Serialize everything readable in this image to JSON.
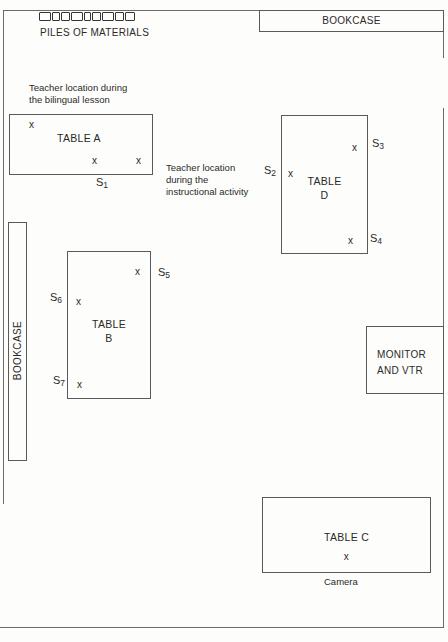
{
  "diagram": {
    "type": "classroom floor plan",
    "labels": {
      "piles_of_materials": "PILES OF MATERIALS",
      "bookcase_top": "BOOKCASE",
      "bookcase_left": "BOOKCASE",
      "teacher_bilingual": "Teacher location during\nthe bilingual lesson",
      "teacher_instructional": "Teacher location\nduring the\ninstructional activity",
      "monitor": "MONITOR\nAND VTR",
      "camera": "Camera"
    },
    "tables": {
      "a": {
        "line1": "TABLE A"
      },
      "b": {
        "line1": "TABLE",
        "line2": "B"
      },
      "c": {
        "line1": "TABLE C"
      },
      "d": {
        "line1": "TABLE",
        "line2": "D"
      }
    },
    "marker": "x",
    "students": {
      "s1": {
        "letter": "S",
        "num": "1"
      },
      "s2": {
        "letter": "S",
        "num": "2"
      },
      "s3": {
        "letter": "S",
        "num": "3"
      },
      "s4": {
        "letter": "S",
        "num": "4"
      },
      "s5": {
        "letter": "S",
        "num": "5"
      },
      "s6": {
        "letter": "S",
        "num": "6"
      },
      "s7": {
        "letter": "S",
        "num": "7"
      }
    },
    "colors": {
      "line": "#5a5a5a",
      "text": "#2a2a2a",
      "background": "#fdfdfb"
    }
  }
}
